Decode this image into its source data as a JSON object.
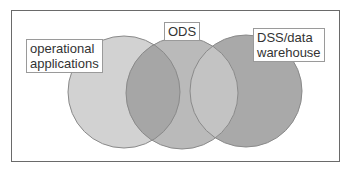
{
  "diagram": {
    "type": "venn",
    "circles": [
      {
        "id": "operational",
        "label_lines": [
          "operational",
          "applications"
        ],
        "fill": "#d2d2d2",
        "cx": 124,
        "cy": 92,
        "r": 56
      },
      {
        "id": "ods",
        "label_lines": [
          "ODS"
        ],
        "fill": "#b9b9b9",
        "cx": 182,
        "cy": 93,
        "r": 56
      },
      {
        "id": "dss",
        "label_lines": [
          "DSS/data",
          "warehouse"
        ],
        "fill": "#a9a9a9",
        "cx": 246,
        "cy": 91,
        "r": 56
      }
    ],
    "labels": {
      "operational_line1": "operational",
      "operational_line2": "applications",
      "ods": "ODS",
      "dss_line1": "DSS/data",
      "dss_line2": "warehouse"
    },
    "colors": {
      "outline": "#8a8a8a",
      "frame": "#6a6a6a",
      "overlap_left": "#a8a8a8",
      "overlap_right": "#a0a0a0"
    }
  }
}
